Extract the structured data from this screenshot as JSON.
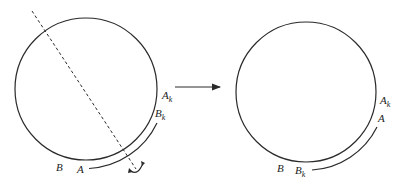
{
  "diagram": {
    "stroke_color": "#2a2a2a",
    "left_panel": {
      "circle": {
        "cx": 86,
        "cy": 89,
        "r": 71
      },
      "axis": {
        "style": "dashed",
        "from": [
          32,
          11
        ],
        "to": [
          136,
          169
        ]
      },
      "labels": {
        "A_k": {
          "base": "A",
          "sub": "k"
        },
        "B_k": {
          "base": "B",
          "sub": "k"
        },
        "B": "B",
        "A": "A"
      },
      "arc": {
        "from_label": "A",
        "to_label": "B_k"
      },
      "rotation_mark": "curved-arrow"
    },
    "arrow": {
      "from": [
        175,
        87
      ],
      "to": [
        221,
        87
      ]
    },
    "right_panel": {
      "circle": {
        "cx": 306,
        "cy": 92,
        "r": 70
      },
      "labels": {
        "A_k": {
          "base": "A",
          "sub": "k"
        },
        "A": "A",
        "B": "B",
        "B_k": {
          "base": "B",
          "sub": "k"
        }
      },
      "arc": {
        "from_label": "B_k",
        "to_label": "A"
      }
    }
  }
}
